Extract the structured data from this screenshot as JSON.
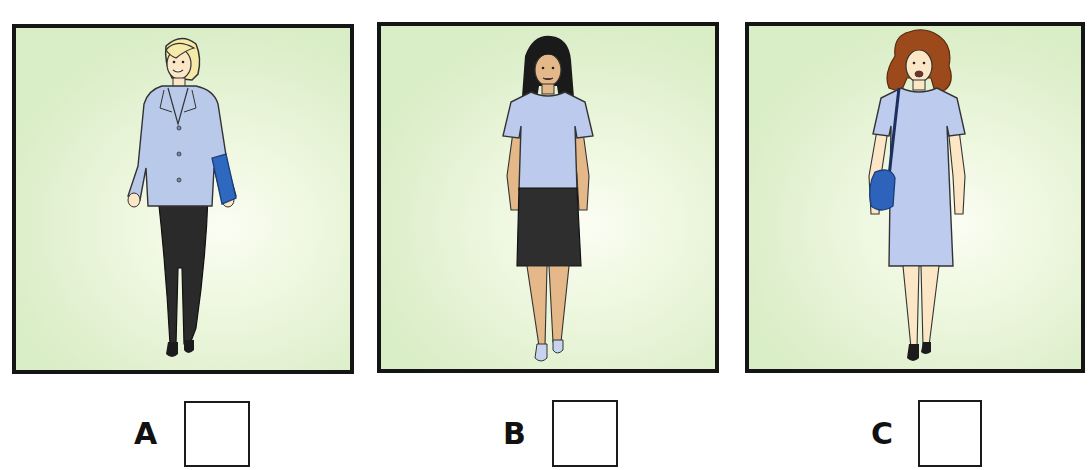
{
  "exercise": {
    "options": [
      {
        "id": "A",
        "label": "A",
        "checked": false,
        "figure": {
          "description": "Woman with short blonde hair wearing a light blue blazer over white top, black trousers, black shoes, carrying a blue folder",
          "hair_color": "#f5eaa8",
          "top_color": "#b9c9ea",
          "bottom_color": "#2a2a2a",
          "accessory": "blue folder",
          "accessory_color": "#2f68bf"
        }
      },
      {
        "id": "B",
        "label": "B",
        "checked": false,
        "figure": {
          "description": "Woman with long black hair wearing a light blue short-sleeved T-shirt, black knee-length skirt, light blue shoes",
          "hair_color": "#1a1a1a",
          "top_color": "#bccbed",
          "bottom_color": "#2e2e2e",
          "accessory": "none"
        }
      },
      {
        "id": "C",
        "label": "C",
        "checked": false,
        "figure": {
          "description": "Woman with curly auburn hair wearing a light blue short-sleeved dress, black shoes, carrying a blue shoulder bag",
          "hair_color": "#9c4a1c",
          "top_color": "#bccbee",
          "bottom_color": "#bccbee",
          "accessory": "blue shoulder bag",
          "accessory_color": "#2e63bb"
        }
      }
    ],
    "colors": {
      "panel_border": "#151515",
      "panel_bg_edge": "#d9edc6",
      "panel_bg_center": "#fbfdf3",
      "skin_light": "#fbe6c6",
      "skin_tan": "#e4b888"
    }
  }
}
